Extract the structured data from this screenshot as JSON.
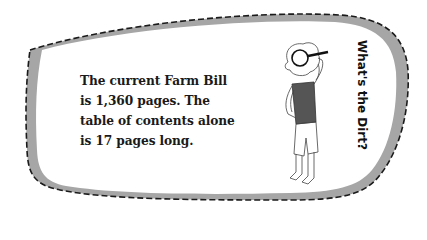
{
  "callout": {
    "lines": [
      "The current Farm Bill",
      "is 1,360 pages. The",
      "table of contents alone",
      "is 17 pages long."
    ],
    "sidebar_title": "What's the Dirt?"
  },
  "colors": {
    "border_dash": "#1a1a1a",
    "shadow_band": "#a6a6a6",
    "shirt": "#555555",
    "background": "#ffffff"
  },
  "illustration": {
    "subject": "person-looking-through-magnifier",
    "icon": "magnifying-glass-icon"
  }
}
